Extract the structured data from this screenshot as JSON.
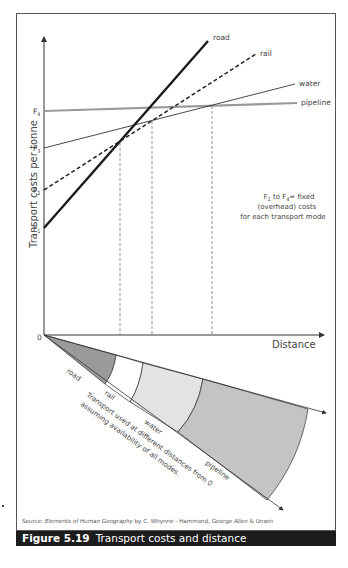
{
  "figure": {
    "number_label": "Figure 5.19",
    "title": "Transport costs and distance",
    "source_prefix": "Source:",
    "source_title": "Elements of Human Geography",
    "source_rest": "by C. Whynne - Hammond, George Allen & Unwin"
  },
  "axes": {
    "y_label": "Transport costs per tonne",
    "x_label": "Distance",
    "origin_label": "0",
    "fixed_cost_ticks": [
      "F1",
      "F2",
      "F3",
      "F4"
    ]
  },
  "annotation": {
    "line1": "F1 to F4= fixed",
    "line2": "(overhead) costs",
    "line3": "for each transport mode"
  },
  "lines": [
    {
      "name": "road",
      "style": "thick solid black",
      "fixed_cost": "F1"
    },
    {
      "name": "rail",
      "style": "dashed black",
      "fixed_cost": "F2"
    },
    {
      "name": "water",
      "style": "thin solid black",
      "fixed_cost": "F3"
    },
    {
      "name": "pipeline",
      "style": "thick solid grey",
      "fixed_cost": "F4"
    }
  ],
  "fan": {
    "caption_line1": "Transport used at different distances from 0",
    "caption_line2": "assuming availability of all modes.",
    "segments": [
      {
        "label": "road",
        "color": "#9a9a9a"
      },
      {
        "label": "rail",
        "color": "#ffffff"
      },
      {
        "label": "water",
        "color": "#e3e3e3"
      },
      {
        "label": "pipeline",
        "color": "#c4c4c4"
      }
    ]
  },
  "colors": {
    "caption_bg": "#1c1c1c",
    "caption_text": "#ffffff",
    "pipeline_line": "#9a9a9a",
    "axis": "#333333"
  }
}
